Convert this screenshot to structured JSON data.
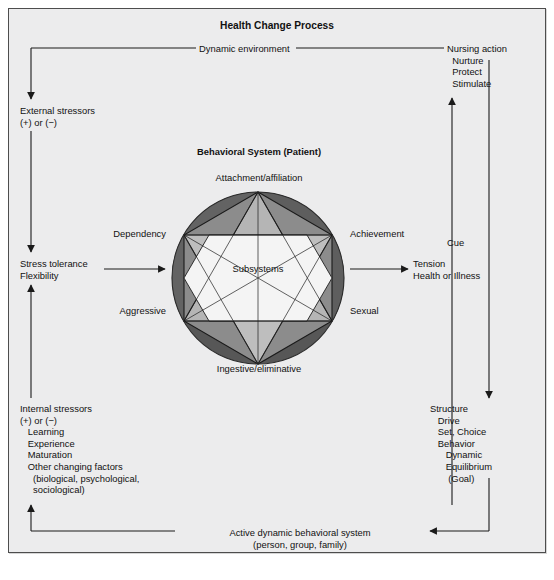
{
  "title": "Health Change Process",
  "flow": {
    "dynamic_environment": "Dynamic environment",
    "nursing_action": "Nursing action\n  Nurture\n  Protect\n  Stimulate",
    "external_stressors": "External stressors\n(+) or (−)",
    "stress_tolerance": "Stress tolerance\nFlexibility",
    "internal_stressors": "Internal stressors\n(+) or (−)\n   Learning\n   Experience\n   Maturation\n   Other changing factors\n     (biological, psychological,\n     sociological)",
    "cue": "Cue",
    "tension": "Tension\nHealth or Illness",
    "structure": "Structure\n   Drive\n   Set, Choice\n   Behavior\n      Dynamic\n      Equilibrium\n       (Goal)",
    "active_system": "Active dynamic behavioral system\n(person, group, family)"
  },
  "behavioral_system": {
    "heading": "Behavioral System (Patient)",
    "center_label": "Subsystems",
    "subsystems": [
      {
        "name": "Attachment/affiliation",
        "position": "top"
      },
      {
        "name": "Achievement",
        "position": "upper-right"
      },
      {
        "name": "Sexual",
        "position": "lower-right"
      },
      {
        "name": "Ingestive/eliminative",
        "position": "bottom"
      },
      {
        "name": "Aggressive",
        "position": "lower-left"
      },
      {
        "name": "Dependency",
        "position": "upper-left"
      }
    ]
  },
  "colors": {
    "page_background": "#ffffff",
    "panel_background": "#ececed",
    "frame_border": "#4d4d4d",
    "line": "#1a1a1a",
    "text": "#111111",
    "circle_dark": "#575757",
    "circle_mid_dark": "#6b6b6b",
    "hex_mid": "#7f7f7f",
    "triangle_light": "#b4b4b4",
    "triangle_lighter": "#c6c6c6",
    "star_center": "#f2f2f2"
  }
}
